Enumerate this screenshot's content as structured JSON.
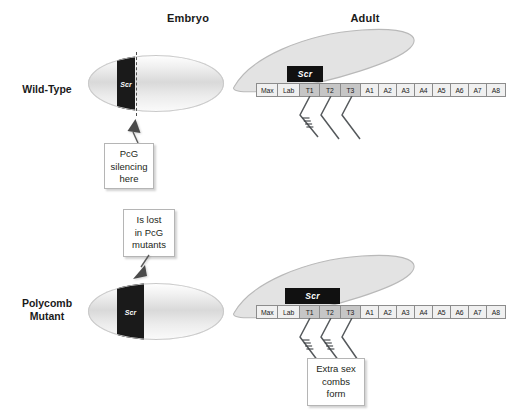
{
  "figure": {
    "columns": [
      {
        "id": "embryo",
        "label": "Embryo"
      },
      {
        "id": "adult",
        "label": "Adult"
      }
    ],
    "rows": [
      {
        "id": "wild-type",
        "label": "Wild-Type"
      },
      {
        "id": "polycomb-mutant",
        "label": "Polycomb\nMutant"
      }
    ]
  },
  "wild_type": {
    "embryo": {
      "band_label": "Scr",
      "has_dashed_boundary": true
    },
    "adult": {
      "scr_box_label": "Scr",
      "scr_box_spans": [
        "T1"
      ],
      "segments": [
        {
          "label": "Max",
          "type": "head"
        },
        {
          "label": "Lab",
          "type": "head"
        },
        {
          "label": "T1",
          "type": "thoracic"
        },
        {
          "label": "T2",
          "type": "thoracic"
        },
        {
          "label": "T3",
          "type": "thoracic"
        },
        {
          "label": "A1",
          "type": "abdominal"
        },
        {
          "label": "A2",
          "type": "abdominal"
        },
        {
          "label": "A3",
          "type": "abdominal"
        },
        {
          "label": "A4",
          "type": "abdominal"
        },
        {
          "label": "A5",
          "type": "abdominal"
        },
        {
          "label": "A6",
          "type": "abdominal"
        },
        {
          "label": "A7",
          "type": "abdominal"
        },
        {
          "label": "A8",
          "type": "abdominal"
        }
      ],
      "legs": [
        {
          "segment": "T1",
          "has_sex_comb": true
        },
        {
          "segment": "T2",
          "has_sex_comb": false
        },
        {
          "segment": "T3",
          "has_sex_comb": false
        }
      ]
    },
    "callout": "PcG\nsilencing\nhere"
  },
  "polycomb_mutant": {
    "embryo": {
      "band_label": "Scr",
      "has_dashed_boundary": false
    },
    "adult": {
      "scr_box_label": "Scr",
      "scr_box_spans": [
        "T1",
        "T2"
      ],
      "segments": [
        {
          "label": "Max",
          "type": "head"
        },
        {
          "label": "Lab",
          "type": "head"
        },
        {
          "label": "T1",
          "type": "thoracic"
        },
        {
          "label": "T2",
          "type": "thoracic"
        },
        {
          "label": "T3",
          "type": "thoracic"
        },
        {
          "label": "A1",
          "type": "abdominal"
        },
        {
          "label": "A2",
          "type": "abdominal"
        },
        {
          "label": "A3",
          "type": "abdominal"
        },
        {
          "label": "A4",
          "type": "abdominal"
        },
        {
          "label": "A5",
          "type": "abdominal"
        },
        {
          "label": "A6",
          "type": "abdominal"
        },
        {
          "label": "A7",
          "type": "abdominal"
        },
        {
          "label": "A8",
          "type": "abdominal"
        }
      ],
      "legs": [
        {
          "segment": "T1",
          "has_sex_comb": true
        },
        {
          "segment": "T2",
          "has_sex_comb": true
        },
        {
          "segment": "T3",
          "has_sex_comb": false
        }
      ]
    },
    "callout_embryo": "Is lost\nin PcG\nmutants",
    "callout_adult": "Extra sex\ncombs\nform"
  },
  "colors": {
    "scr_band": "#1a1a1a",
    "thoracic_segment": "#c6c6c6",
    "other_segment": "#f0f0f0",
    "wing_fill": "#e3e3e3",
    "outline": "#8c8c8c"
  }
}
